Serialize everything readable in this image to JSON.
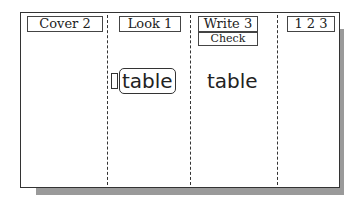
{
  "columns": [
    {
      "id": "cover",
      "header": "Cover 2"
    },
    {
      "id": "look",
      "header": "Look 1",
      "word": "table",
      "word_style": "boxed-outline"
    },
    {
      "id": "write",
      "header": "Write 3",
      "subheader": "Check",
      "word": "table"
    },
    {
      "id": "count",
      "header": "1 2 3"
    }
  ]
}
